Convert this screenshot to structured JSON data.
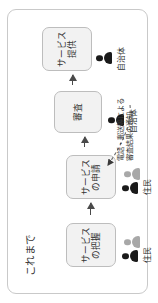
{
  "diagram": {
    "title": "これまで",
    "steps": [
      {
        "id": "step-service-awareness",
        "label": "サービスの把握"
      },
      {
        "id": "step-service-application",
        "label": "サービスの申請"
      },
      {
        "id": "step-review",
        "label": "審査"
      },
      {
        "id": "step-service-provision",
        "label": "サービス提供"
      }
    ],
    "actors": [
      {
        "id": "actor-residents-1",
        "label": "住民"
      },
      {
        "id": "actor-residents-2",
        "label": "住民"
      },
      {
        "id": "actor-municipality-1",
        "label": "自治体"
      },
      {
        "id": "actor-municipality-2",
        "label": "自治体"
      }
    ],
    "annotation": {
      "line1": "電話・郵送等による",
      "line2": "審査結果の通知"
    },
    "colors": {
      "frame_border": "#c9c9c9",
      "box_fill": "#f2f2f2",
      "box_border": "#bdbdbd",
      "arrow": "#4a4a4a",
      "actor_dark": "#1a1a1a",
      "actor_gray": "#a8a8a8",
      "text": "#333333"
    }
  }
}
